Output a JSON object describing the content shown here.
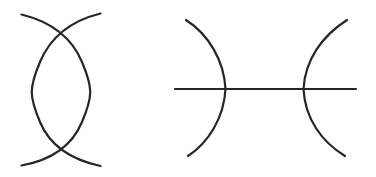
{
  "figure": {
    "background_color": "#ffffff",
    "stroke_color": "#262626",
    "stroke_width": 2.2,
    "width": 376,
    "height": 177,
    "title": "",
    "caption": "",
    "panels": [
      {
        "id": "left-panel",
        "name": "lens-two-crossing-arcs",
        "description": "Two vertical arcs bowing away from each other, crossing near the top and near the bottom to form a lens (vesica) shape with small tails extending past each crossing.",
        "bounds": {
          "x": 14,
          "y": 10,
          "width": 92,
          "height": 158
        },
        "elements": [
          {
            "id": "left-arc",
            "name": "left-bowing-arc",
            "type": "arc",
            "description": "Arc running from upper-left tail down around the left side to the lower-left tail, bulging leftward.",
            "path": "M 21.5 14.5 C 52 22 72 38 82 62 C 93 88 93 96 82 122 C 72 146 52 160 21.5 165.5",
            "endpoints": [
              [
                21.5,
                14.5
              ],
              [
                21.5,
                165.5
              ]
            ]
          },
          {
            "id": "right-arc",
            "name": "right-bowing-arc",
            "type": "arc",
            "description": "Mirror arc running from upper-right tail down around the right side to the lower-right tail, bulging rightward.",
            "path": "M 100.5 13.5 C 70 21 50 38 40 62 C 29 88 29 96 40 122 C 50 146 70 159.5 100.5 166",
            "endpoints": [
              [
                100.5,
                13.5
              ],
              [
                100.5,
                166
              ]
            ]
          }
        ],
        "crossings": [
          {
            "name": "top-crossing",
            "x": 60,
            "y": 34
          },
          {
            "name": "bottom-crossing",
            "x": 60,
            "y": 147
          }
        ]
      },
      {
        "id": "right-panel",
        "name": "two-facing-arcs-with-horizontal-line",
        "description": "A left arc opening leftward and a right arc opening rightward, both intersected near their midpoints by a single horizontal straight line that extends beyond both arcs.",
        "bounds": {
          "x": 175,
          "y": 18,
          "width": 182,
          "height": 140
        },
        "elements": [
          {
            "id": "left-facing-arc",
            "name": "left-arc-concave-left",
            "type": "arc",
            "description": "Arc from upper-left tip, bulging rightward to its rightmost point on the horizontal line, then back to lower-left tip.",
            "path": "M 186 20 C 208 34 224 60 225.5 89 C 224 118 208 143 188 156",
            "endpoints": [
              [
                186,
                20
              ],
              [
                188,
                156
              ]
            ],
            "apex": [
              225.5,
              89
            ]
          },
          {
            "id": "right-facing-arc",
            "name": "right-arc-concave-right",
            "type": "arc",
            "description": "Arc from upper-right tip, bulging leftward to its leftmost point on the horizontal line, then back to lower-right tip.",
            "path": "M 347 20 C 322 36 305 60 303.5 89 C 305 119 322 142 345 156",
            "endpoints": [
              [
                347,
                20
              ],
              [
                345,
                156
              ]
            ],
            "apex": [
              303.5,
              89
            ]
          },
          {
            "id": "horizontal-line",
            "name": "horizontal-bisecting-line",
            "type": "line",
            "description": "Straight horizontal segment crossing both arcs at their apexes.",
            "path": "M 175 89 L 356 89",
            "endpoints": [
              [
                175,
                89
              ],
              [
                356,
                89
              ]
            ]
          }
        ],
        "crossings": [
          {
            "name": "left-arc-line-crossing",
            "x": 225.5,
            "y": 89
          },
          {
            "name": "right-arc-line-crossing",
            "x": 303.5,
            "y": 89
          }
        ]
      }
    ]
  }
}
